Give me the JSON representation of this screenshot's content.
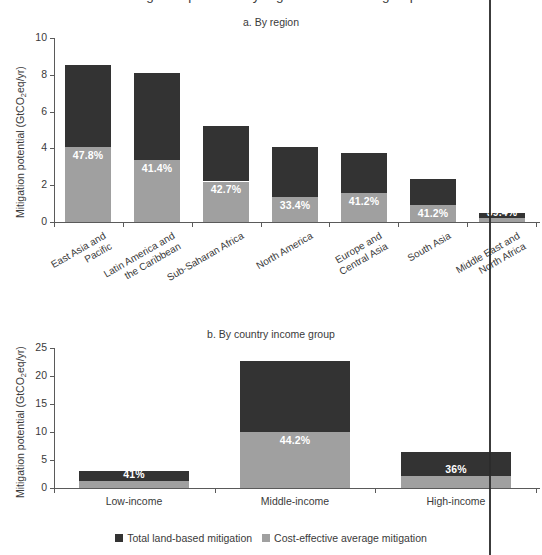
{
  "figure": {
    "clipped_top_title": "Mitigation potential by region and income group",
    "legend": [
      {
        "label": "Total land-based mitigation",
        "color": "#333333",
        "key": "total"
      },
      {
        "label": "Cost-effective average mitigation",
        "color": "#a0a0a0",
        "key": "cost_effective"
      }
    ],
    "colors": {
      "total_land_based": "#333333",
      "cost_effective": "#a0a0a0",
      "axis": "#5a5a5a",
      "text": "#3a3a3a",
      "value_label": "#ffffff",
      "background": "#ffffff",
      "scan_artifact": "#2b2b2b"
    }
  },
  "chart_data": [
    {
      "type": "bar",
      "id": "panel-a",
      "title": "a. By region",
      "stacked": true,
      "xlabel": "",
      "ylabel": "Mitigation potential (GtCO2eq/yr)",
      "ylim": [
        0,
        10
      ],
      "yticks": [
        0,
        2,
        4,
        6,
        8,
        10
      ],
      "ytick_labels": [
        "0",
        "2",
        "4",
        "6",
        "8",
        "10"
      ],
      "grid": false,
      "legend_position": "bottom-shared",
      "categories": [
        "East Asia and Pacific",
        "Latin America and the Caribbean",
        "Sub-Saharan Africa",
        "North America",
        "Europe and Central Asia",
        "South Asia",
        "Middle East and North Africa"
      ],
      "category_lines": [
        [
          "East Asia and",
          "Pacific"
        ],
        [
          "Latin America and",
          "the Caribbean"
        ],
        [
          "Sub-Saharan Africa"
        ],
        [
          "North America"
        ],
        [
          "Europe and",
          "Central Asia"
        ],
        [
          "South Asia"
        ],
        [
          "Middle East and",
          "North Africa"
        ]
      ],
      "series": [
        {
          "name": "Total land-based mitigation",
          "values": [
            8.55,
            8.1,
            5.2,
            4.05,
            3.75,
            2.35,
            0.5
          ]
        },
        {
          "name": "Cost-effective average mitigation",
          "values": [
            4.1,
            3.35,
            2.2,
            1.35,
            1.55,
            0.95,
            0.2
          ]
        }
      ],
      "data_labels": [
        "47.8%",
        "41.4%",
        "42.7%",
        "33.4%",
        "41.2%",
        "41.2%",
        "39.4%"
      ],
      "data_label_note": "Last label partially obscured by a vertical scan line in the source image"
    },
    {
      "type": "bar",
      "id": "panel-b",
      "title": "b. By country income group",
      "stacked": true,
      "xlabel": "",
      "ylabel": "Mitigation potential (GtCO2eq/yr)",
      "ylim": [
        0,
        25
      ],
      "yticks": [
        0,
        5,
        10,
        15,
        20,
        25
      ],
      "ytick_labels": [
        "0",
        "5",
        "10",
        "15",
        "20",
        "25"
      ],
      "grid": false,
      "legend_position": "bottom",
      "categories": [
        "Low-income",
        "Middle-income",
        "High-income"
      ],
      "series": [
        {
          "name": "Total land-based mitigation",
          "values": [
            2.95,
            22.7,
            6.5
          ]
        },
        {
          "name": "Cost-effective average mitigation",
          "values": [
            1.2,
            10.0,
            2.2
          ]
        }
      ],
      "data_labels": [
        "41%",
        "44.2%",
        "36%"
      ]
    }
  ]
}
